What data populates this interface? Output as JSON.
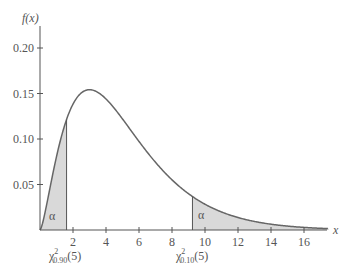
{
  "chart_data": {
    "type": "area",
    "title": "",
    "ylabel": "f(x)",
    "xlabel": "x",
    "distribution": "chi-square",
    "degrees_of_freedom": 5,
    "xlim": [
      0,
      17.5
    ],
    "ylim": [
      0,
      0.22
    ],
    "x_ticks": [
      2,
      4,
      6,
      8,
      10,
      12,
      14,
      16
    ],
    "y_ticks": [
      0.05,
      0.1,
      0.15,
      0.2
    ],
    "y_tick_labels": [
      "0.05",
      "0.10",
      "0.15",
      "0.20"
    ],
    "curve_peak": {
      "x": 3,
      "y": 0.154
    },
    "shaded_regions": [
      {
        "label": "α",
        "from": 0,
        "to": 1.61,
        "cutoff_label": "χ²0.90(5)"
      },
      {
        "label": "α",
        "from": 9.24,
        "to": 17.5,
        "cutoff_label": "χ²0.10(5)"
      }
    ],
    "grid": false,
    "colors": {
      "curve": "#666666",
      "fill": "#d9d9d9",
      "axis": "#555555"
    }
  },
  "labels": {
    "y_axis": "f(x)",
    "x_axis": "x",
    "alpha_left": "α",
    "alpha_right": "α",
    "chi": "χ",
    "sup": "2",
    "sub_left": "0.90",
    "sub_right": "0.10",
    "df": "(5)"
  }
}
